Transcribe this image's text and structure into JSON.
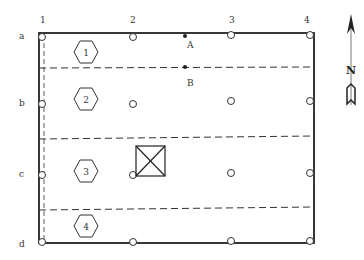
{
  "diagram": {
    "column_labels": [
      "1",
      "2",
      "3",
      "4"
    ],
    "row_labels": [
      "a",
      "b",
      "c",
      "d"
    ],
    "points": [
      {
        "label": "A"
      },
      {
        "label": "B"
      }
    ],
    "zones": [
      {
        "label": "1"
      },
      {
        "label": "2"
      },
      {
        "label": "3"
      },
      {
        "label": "4"
      }
    ],
    "north_label": "N",
    "colors": {
      "line": "#222222",
      "background": "#ffffff"
    }
  }
}
